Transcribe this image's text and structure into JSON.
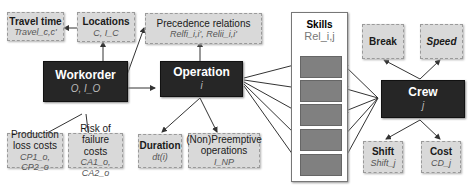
{
  "nodes": {
    "travel_time": {
      "title": "Travel time",
      "symbol": "Travel_c,c'"
    },
    "locations": {
      "title": "Locations",
      "symbol": "C, I_C"
    },
    "precedence": {
      "title": "Precedence relations",
      "symbol": "Relfi_i,i', Relii_i,i'"
    },
    "workorder": {
      "title": "Workorder",
      "symbol": "O, I_O"
    },
    "operation": {
      "title": "Operation",
      "symbol": "i"
    },
    "skills": {
      "title": "Skills",
      "symbol": "Rel_i,j"
    },
    "crew": {
      "title": "Crew",
      "symbol": "j"
    },
    "break": {
      "title": "Break"
    },
    "speed": {
      "title": "Speed"
    },
    "production_loss": {
      "title": "Production loss costs",
      "symbol": "CP1_o, CP2_o"
    },
    "failure_risk": {
      "title": "Risk of failure costs",
      "symbol": "CA1_o, CA2_o"
    },
    "duration": {
      "title": "Duration",
      "symbol": "dt(i)"
    },
    "preemptive": {
      "title": "(Non)Preemptive operations",
      "symbol": "I_NP"
    },
    "shift": {
      "title": "Shift",
      "symbol": "Shift_j"
    },
    "cost": {
      "title": "Cost",
      "symbol": "CD_j"
    }
  },
  "colors": {
    "dark_node": "#262626",
    "light_node": "#d9d9d9",
    "skill_slot": "#808080",
    "arrow": "#333333"
  }
}
